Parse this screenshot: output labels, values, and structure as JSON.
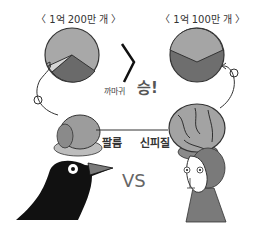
{
  "left_label": "〈 1억 200만 개 〉",
  "right_label": "〈 1억 100만 개 〉",
  "comparison_symbol": "〉",
  "winner_text_small": "까마귀",
  "winner_text_big": "승!",
  "pallium_label": "팔륨",
  "neocortex_label": "신피질",
  "vs_label": "VS",
  "colors": {
    "light": "#b8b8b8",
    "mid": "#9a9a9a",
    "dark": "#6a6a6a",
    "black": "#111111",
    "monkey": "#7a7a7a"
  }
}
